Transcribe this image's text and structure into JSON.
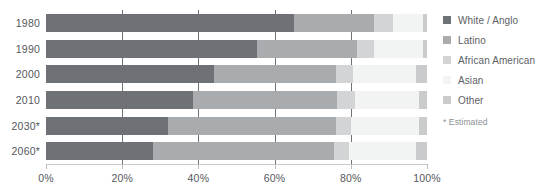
{
  "chart_data": {
    "type": "bar",
    "orientation": "horizontal",
    "stacked": true,
    "normalized": true,
    "title": "",
    "subtitle": "",
    "xlabel": "",
    "ylabel": "",
    "xlim": [
      0,
      100
    ],
    "grid": true,
    "legend_position": "right",
    "categories": [
      "1980",
      "1990",
      "2000",
      "2010",
      "2030*",
      "2060*"
    ],
    "xtick_labels": [
      "0%",
      "20%",
      "40%",
      "60%",
      "80%",
      "100%"
    ],
    "xtick_values": [
      0,
      20,
      40,
      60,
      80,
      100
    ],
    "series": [
      {
        "name": "White / Anglo",
        "color": "#6e7175",
        "values": [
          65.0,
          55.5,
          44.0,
          38.5,
          32.0,
          28.0
        ]
      },
      {
        "name": "Latino",
        "color": "#a9acae",
        "values": [
          21.0,
          26.0,
          32.0,
          38.0,
          44.0,
          47.5
        ]
      },
      {
        "name": "African American",
        "color": "#d2d4d5",
        "values": [
          5.0,
          4.5,
          4.5,
          4.5,
          4.0,
          4.0
        ]
      },
      {
        "name": "Asian",
        "color": "#f2f3f3",
        "values": [
          8.0,
          13.0,
          16.5,
          17.0,
          18.0,
          17.5
        ]
      },
      {
        "name": "Other",
        "color": "#c9cbcc",
        "values": [
          1.0,
          1.0,
          3.0,
          2.0,
          2.0,
          3.0
        ]
      }
    ],
    "note": "* Estimated"
  },
  "legend": {
    "items": [
      {
        "label": "White / Anglo"
      },
      {
        "label": "Latino"
      },
      {
        "label": "African American"
      },
      {
        "label": "Asian"
      },
      {
        "label": "Other"
      }
    ],
    "note": "* Estimated"
  }
}
